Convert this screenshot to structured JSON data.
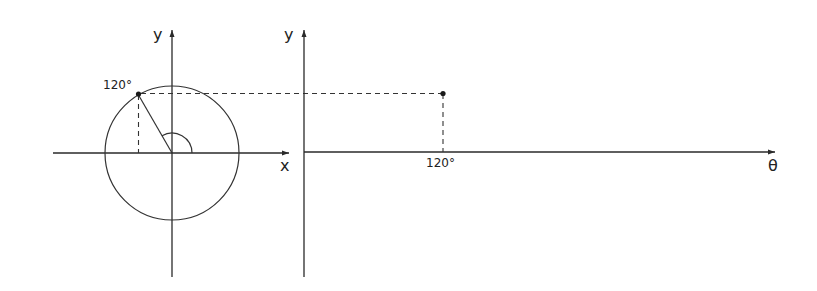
{
  "diagram": {
    "title": "",
    "left_panel": {
      "description": "Unit circle with point at 120 degrees",
      "x_axis_label": "x",
      "y_axis_label": "y",
      "point_label": "120°",
      "angle_deg": 120
    },
    "right_panel": {
      "description": "Projection of y-coordinate onto theta axis",
      "x_axis_label": "θ",
      "y_axis_label": "y",
      "tick_label": "120°"
    },
    "colors": {
      "stroke": "#2a2a2a",
      "background": "#ffffff"
    }
  }
}
